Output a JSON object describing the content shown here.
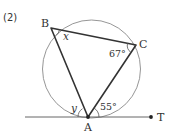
{
  "problem_number": "(2)",
  "points": {
    "A": {
      "label": "A"
    },
    "B": {
      "label": "B"
    },
    "C": {
      "label": "C"
    },
    "T": {
      "label": "T"
    }
  },
  "angles": {
    "at_B": {
      "label": "x",
      "unknown": true
    },
    "at_C": {
      "label": "67°",
      "value_deg": 67
    },
    "tangent_left": {
      "label": "y",
      "unknown": true
    },
    "tangent_right": {
      "label": "55°",
      "value_deg": 55
    }
  },
  "elements": {
    "circle": "circumscribed circle through A, B, C",
    "triangle": "triangle ABC inscribed in circle",
    "tangent_line": "line tangent to circle at A, extending to point T"
  },
  "colors": {
    "circle": "#8a8a8a",
    "triangle": "#333333",
    "tangent": "#555555",
    "text": "#333333"
  }
}
